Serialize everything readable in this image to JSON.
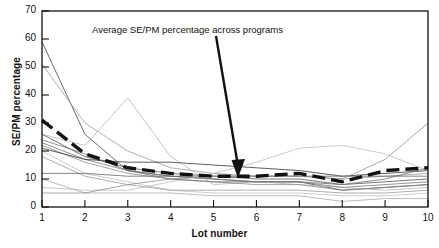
{
  "chart_data": {
    "type": "line",
    "title": "",
    "xlabel": "Lot number",
    "ylabel": "SE/PM percentage",
    "xlim": [
      1,
      10
    ],
    "ylim": [
      0,
      70
    ],
    "yticks": [
      0,
      10,
      20,
      30,
      40,
      50,
      60,
      70
    ],
    "xticks": [
      1,
      2,
      3,
      4,
      5,
      6,
      7,
      8,
      9,
      10
    ],
    "grid": false,
    "legend": "none",
    "annotations": [
      {
        "text": "Average SE/PM percentage across programs",
        "points_to_series": "Average SE/PM percentage across programs",
        "points_to_x": 5.2,
        "points_to_y": 11
      }
    ],
    "x": [
      1,
      2,
      3,
      4,
      5,
      6,
      7,
      8,
      9,
      10
    ],
    "series": [
      {
        "name": "Average SE/PM percentage across programs",
        "style": "bold-dashed",
        "color": "#111111",
        "values": [
          31,
          19,
          14,
          12,
          11,
          11,
          12,
          9,
          13,
          14
        ]
      },
      {
        "name": "Program 1",
        "style": "thin",
        "color": "#444444",
        "values": [
          59,
          26,
          13,
          11,
          10,
          9,
          9,
          6,
          7,
          8
        ]
      },
      {
        "name": "Program 2",
        "style": "thin",
        "color": "#9a9a9a",
        "values": [
          51,
          30,
          20,
          14,
          12,
          11,
          11,
          10,
          11,
          12
        ]
      },
      {
        "name": "Program 3",
        "style": "thin",
        "color": "#b5b5b5",
        "values": [
          26,
          22,
          39,
          18,
          8,
          9,
          8,
          7,
          6,
          7
        ]
      },
      {
        "name": "Program 4",
        "style": "thin",
        "color": "#555555",
        "values": [
          26,
          18,
          14,
          12,
          11,
          10,
          10,
          8,
          9,
          10
        ]
      },
      {
        "name": "Program 5",
        "style": "thin",
        "color": "#777777",
        "values": [
          23,
          17,
          13,
          11,
          10,
          9,
          9,
          7,
          8,
          9
        ]
      },
      {
        "name": "Program 6",
        "style": "thin",
        "color": "#8a8a8a",
        "values": [
          22,
          16,
          12,
          10,
          9,
          8,
          8,
          6,
          7,
          8
        ]
      },
      {
        "name": "Program 7",
        "style": "thin",
        "color": "#333333",
        "values": [
          21,
          17,
          16,
          16,
          15,
          14,
          13,
          11,
          12,
          13
        ]
      },
      {
        "name": "Program 8",
        "style": "thin",
        "color": "#c0c0c0",
        "values": [
          20,
          12,
          9,
          6,
          5,
          5,
          5,
          4,
          4,
          5
        ]
      },
      {
        "name": "Program 9",
        "style": "thin",
        "color": "#999999",
        "values": [
          18,
          11,
          8,
          6,
          6,
          6,
          6,
          5,
          5,
          6
        ]
      },
      {
        "name": "Program 10",
        "style": "thin",
        "color": "#666666",
        "values": [
          12,
          12,
          11,
          11,
          11,
          11,
          11,
          11,
          11,
          11
        ]
      },
      {
        "name": "Program 11",
        "style": "thin",
        "color": "#aaaaaa",
        "values": [
          10,
          5,
          5,
          5,
          4,
          4,
          4,
          2,
          3,
          3
        ]
      },
      {
        "name": "Program 12",
        "style": "thin",
        "color": "#bcbcbc",
        "values": [
          7,
          6,
          6,
          9,
          12,
          16,
          21,
          22,
          19,
          13
        ]
      },
      {
        "name": "Program 13",
        "style": "thin",
        "color": "#8f8f8f",
        "values": [
          5,
          5,
          8,
          10,
          11,
          11,
          11,
          10,
          17,
          30
        ]
      },
      {
        "name": "Program 14",
        "style": "thin",
        "color": "#707070",
        "values": [
          24,
          19,
          13,
          10,
          9,
          9,
          9,
          8,
          10,
          14
        ]
      }
    ]
  },
  "axes": {
    "y_tick_labels": [
      "0",
      "10",
      "20",
      "30",
      "40",
      "50",
      "60",
      "70"
    ],
    "x_tick_labels": [
      "1",
      "2",
      "3",
      "4",
      "5",
      "6",
      "7",
      "8",
      "9",
      "10"
    ],
    "y_axis_title": "SE/PM percentage",
    "x_axis_title": "Lot number"
  },
  "annotation": {
    "label": "Average SE/PM percentage across programs"
  },
  "colors": {
    "axis": "#111111",
    "average_line": "#111111",
    "background": "#ffffff"
  }
}
